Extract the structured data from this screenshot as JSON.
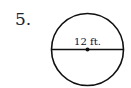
{
  "problem": {
    "number": "5.",
    "diameter_label": "12 ft."
  },
  "figure": {
    "shape": "circle",
    "segment": "diameter",
    "stroke_color": "#111111"
  }
}
